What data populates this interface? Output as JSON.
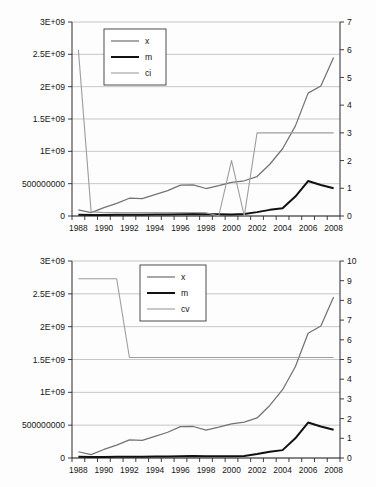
{
  "chart_data": [
    {
      "type": "line",
      "title": "",
      "xlabel": "",
      "ylabel": "",
      "grid": true,
      "legend_position": "top-left",
      "x": [
        1987,
        1988,
        1989,
        1990,
        1991,
        1992,
        1993,
        1994,
        1995,
        1996,
        1997,
        1998,
        1999,
        2000,
        2001,
        2002,
        2003,
        2004,
        2005,
        2006,
        2007
      ],
      "xtick_labels": [
        "1988",
        "1990",
        "1992",
        "1994",
        "1996",
        "1998",
        "2000",
        "2002",
        "2004",
        "2006",
        "2008"
      ],
      "xtick_values": [
        1988,
        1990,
        1992,
        1994,
        1996,
        1998,
        2000,
        2002,
        2004,
        2006,
        2008
      ],
      "left_axis": {
        "ylim": [
          0,
          3000000000
        ],
        "tick_values": [
          0,
          500000000,
          1000000000,
          1500000000,
          2000000000,
          2500000000,
          3000000000
        ],
        "tick_labels": [
          "0",
          "500000000",
          "1E+09",
          "1.5E+09",
          "2E+09",
          "2.5E+09",
          "3E+09"
        ]
      },
      "right_axis": {
        "ylim": [
          0,
          7
        ],
        "tick_values": [
          0,
          1,
          2,
          3,
          4,
          5,
          6,
          7
        ],
        "tick_labels": [
          "0",
          "1",
          "2",
          "3",
          "4",
          "5",
          "6",
          "7"
        ]
      },
      "series": [
        {
          "name": "x",
          "axis": "left",
          "color": "#737373",
          "values": [
            95000000,
            52000000,
            130000000,
            195000000,
            275000000,
            268000000,
            330000000,
            392000000,
            478000000,
            480000000,
            425000000,
            470000000,
            520000000,
            545000000,
            610000000,
            800000000,
            1040000000,
            1390000000,
            1900000000,
            2010000000,
            2450000000,
            2800000000
          ]
        },
        {
          "name": "m",
          "axis": "left",
          "color": "#111111",
          "values": [
            18000000,
            16000000,
            17000000,
            18000000,
            19000000,
            20000000,
            22000000,
            24000000,
            27000000,
            30000000,
            27000000,
            26000000,
            25000000,
            30000000,
            60000000,
            95000000,
            120000000,
            300000000,
            540000000,
            480000000,
            430000000,
            540000000
          ]
        },
        {
          "name": "ci",
          "axis": "right",
          "color": "#9d9d9d",
          "values": [
            6.0,
            0.15,
            0.12,
            0.12,
            0.12,
            0.12,
            0.12,
            0.12,
            0.12,
            0.12,
            0.12,
            0.0,
            2.0,
            0.0,
            3.0,
            3.0,
            3.0,
            3.0,
            3.0,
            3.0,
            3.0
          ]
        }
      ]
    },
    {
      "type": "line",
      "title": "",
      "xlabel": "",
      "ylabel": "",
      "grid": true,
      "legend_position": "top-center",
      "x": [
        1987,
        1988,
        1989,
        1990,
        1991,
        1992,
        1993,
        1994,
        1995,
        1996,
        1997,
        1998,
        1999,
        2000,
        2001,
        2002,
        2003,
        2004,
        2005,
        2006,
        2007
      ],
      "xtick_labels": [
        "1988",
        "1990",
        "1992",
        "1994",
        "1996",
        "1998",
        "2000",
        "2002",
        "2004",
        "2006",
        "2008"
      ],
      "xtick_values": [
        1988,
        1990,
        1992,
        1994,
        1996,
        1998,
        2000,
        2002,
        2004,
        2006,
        2008
      ],
      "left_axis": {
        "ylim": [
          0,
          3000000000
        ],
        "tick_values": [
          0,
          500000000,
          1000000000,
          1500000000,
          2000000000,
          2500000000,
          3000000000
        ],
        "tick_labels": [
          "0",
          "500000000",
          "1E+09",
          "1.5E+09",
          "2E+09",
          "2.5E+09",
          "3E+09"
        ]
      },
      "right_axis": {
        "ylim": [
          0,
          10
        ],
        "tick_values": [
          0,
          1,
          2,
          3,
          4,
          5,
          6,
          7,
          8,
          9,
          10
        ],
        "tick_labels": [
          "0",
          "1",
          "2",
          "3",
          "4",
          "5",
          "6",
          "7",
          "8",
          "9",
          "10"
        ]
      },
      "series": [
        {
          "name": "x",
          "axis": "left",
          "color": "#737373",
          "values": [
            95000000,
            52000000,
            130000000,
            195000000,
            275000000,
            268000000,
            330000000,
            392000000,
            478000000,
            480000000,
            425000000,
            470000000,
            520000000,
            545000000,
            610000000,
            800000000,
            1040000000,
            1390000000,
            1900000000,
            2010000000,
            2450000000,
            2800000000
          ]
        },
        {
          "name": "m",
          "axis": "left",
          "color": "#111111",
          "values": [
            18000000,
            16000000,
            17000000,
            18000000,
            19000000,
            20000000,
            22000000,
            24000000,
            27000000,
            30000000,
            27000000,
            26000000,
            25000000,
            30000000,
            60000000,
            95000000,
            120000000,
            300000000,
            540000000,
            480000000,
            430000000,
            540000000
          ]
        },
        {
          "name": "cv",
          "axis": "right",
          "color": "#9d9d9d",
          "values": [
            9.1,
            9.1,
            9.1,
            9.1,
            5.1,
            5.1,
            5.1,
            5.1,
            5.1,
            5.1,
            5.1,
            5.1,
            5.1,
            5.1,
            5.1,
            5.1,
            5.1,
            5.1,
            5.1,
            5.1,
            5.1
          ]
        }
      ]
    }
  ]
}
